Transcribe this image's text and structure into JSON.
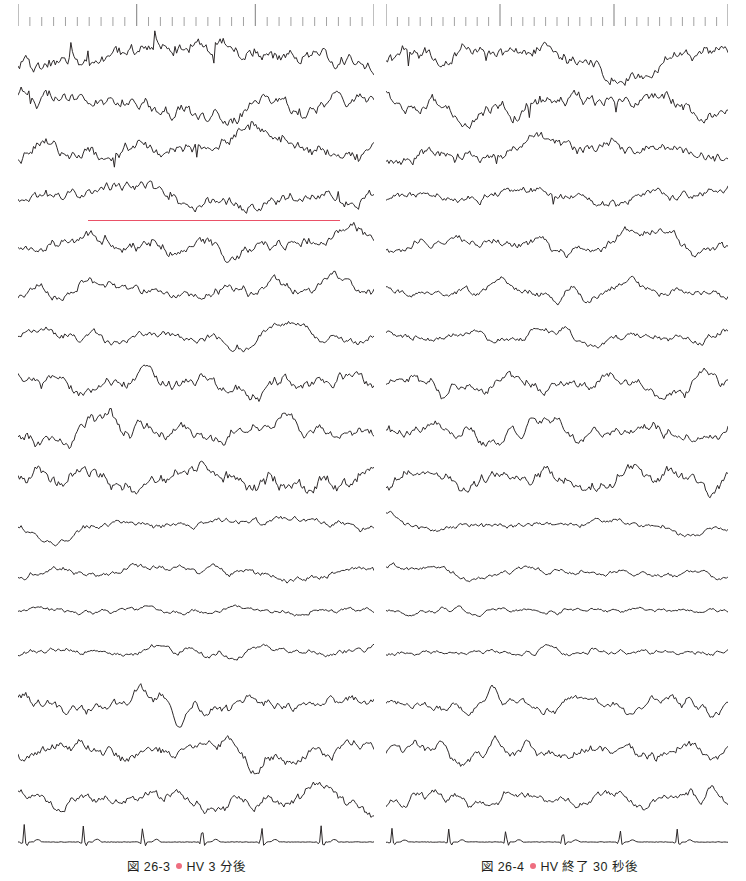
{
  "figure": {
    "kind": "eeg-recording",
    "background_color": "#ffffff",
    "trace_color": "#231f20",
    "annotation_color": "#e8425a",
    "bullet_color": "#ee6e80",
    "channel_count": 17,
    "panels": [
      {
        "id": "left",
        "caption_number": "図 26-3",
        "caption_text": "HV 3 分後",
        "annotation": {
          "type": "horizontal-bar",
          "color": "#e8425a",
          "x_start": 88,
          "x_end": 340,
          "y": 220,
          "under_channel_index": 3
        }
      },
      {
        "id": "right",
        "caption_number": "図 26-4",
        "caption_text": "HV 終了 30 秒後",
        "annotation": null
      }
    ],
    "timescale": {
      "major_tick_count": 3,
      "minor_per_major": 10,
      "major_tick_height": 22,
      "minor_tick_height": 9,
      "tick_color": "#8a8a8a"
    }
  },
  "chart_data": {
    "type": "line",
    "title": "",
    "xlabel": "",
    "ylabel": "",
    "grid": false,
    "legend": "none",
    "x": {
      "range": [
        0,
        1
      ],
      "units": "seconds-normalized",
      "samples_per_trace": 230
    },
    "channels": [
      {
        "index": 0,
        "baseline_y": 56,
        "amplitude": 19,
        "frequency": 2.1,
        "noise": 0.55,
        "kind": "delta-slow"
      },
      {
        "index": 1,
        "baseline_y": 103,
        "amplitude": 18,
        "frequency": 2.3,
        "noise": 0.55,
        "kind": "delta-slow"
      },
      {
        "index": 2,
        "baseline_y": 149,
        "amplitude": 16,
        "frequency": 2.6,
        "noise": 0.55,
        "kind": "delta-slow"
      },
      {
        "index": 3,
        "baseline_y": 196,
        "amplitude": 14,
        "frequency": 2.8,
        "noise": 0.5,
        "kind": "delta-theta"
      },
      {
        "index": 4,
        "baseline_y": 243,
        "amplitude": 15,
        "frequency": 3.4,
        "noise": 0.5,
        "kind": "theta"
      },
      {
        "index": 5,
        "baseline_y": 290,
        "amplitude": 13,
        "frequency": 4.6,
        "noise": 0.45,
        "kind": "theta"
      },
      {
        "index": 6,
        "baseline_y": 337,
        "amplitude": 12,
        "frequency": 6.4,
        "noise": 0.45,
        "kind": "theta-alpha"
      },
      {
        "index": 7,
        "baseline_y": 384,
        "amplitude": 16,
        "frequency": 6.0,
        "noise": 0.5,
        "kind": "theta-alpha"
      },
      {
        "index": 8,
        "baseline_y": 431,
        "amplitude": 16,
        "frequency": 5.6,
        "noise": 0.5,
        "kind": "theta-alpha"
      },
      {
        "index": 9,
        "baseline_y": 478,
        "amplitude": 17,
        "frequency": 5.2,
        "noise": 0.55,
        "kind": "theta-alpha"
      },
      {
        "index": 10,
        "baseline_y": 525,
        "amplitude": 11,
        "frequency": 2.7,
        "noise": 0.4,
        "kind": "slow-low"
      },
      {
        "index": 11,
        "baseline_y": 572,
        "amplitude": 10,
        "frequency": 2.9,
        "noise": 0.4,
        "kind": "slow-low"
      },
      {
        "index": 12,
        "baseline_y": 611,
        "amplitude": 4,
        "frequency": 9.5,
        "noise": 0.7,
        "kind": "low-voltage-fast"
      },
      {
        "index": 13,
        "baseline_y": 652,
        "amplitude": 5,
        "frequency": 8.8,
        "noise": 0.7,
        "kind": "low-voltage-fast"
      },
      {
        "index": 14,
        "baseline_y": 705,
        "amplitude": 13,
        "frequency": 7.6,
        "noise": 0.5,
        "kind": "alpha"
      },
      {
        "index": 15,
        "baseline_y": 752,
        "amplitude": 14,
        "frequency": 7.0,
        "noise": 0.5,
        "kind": "alpha"
      },
      {
        "index": 16,
        "baseline_y": 799,
        "amplitude": 13,
        "frequency": 6.6,
        "noise": 0.5,
        "kind": "alpha"
      },
      {
        "index": 17,
        "baseline_y": 842,
        "amplitude": 3,
        "frequency": 1.2,
        "noise": 0.1,
        "kind": "ecg",
        "beats": 6
      }
    ],
    "panel_variation": {
      "left": {
        "amp_scale": 1.15,
        "freq_scale": 0.88,
        "seed": 17
      },
      "right": {
        "amp_scale": 0.92,
        "freq_scale": 1.22,
        "seed": 91
      }
    }
  }
}
